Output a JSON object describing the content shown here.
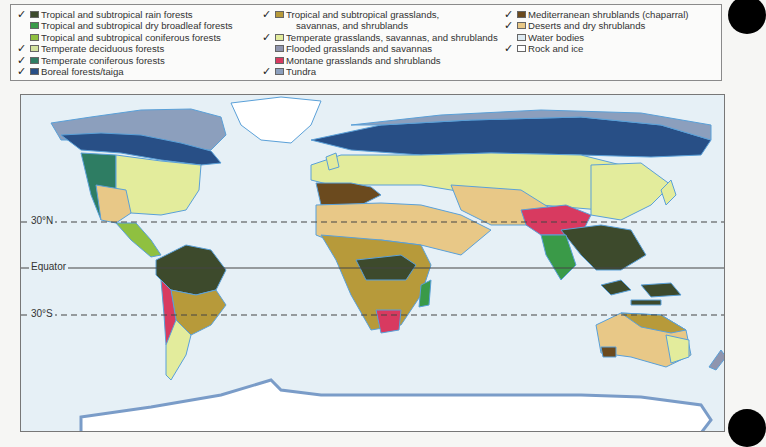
{
  "legend": {
    "columns": [
      [
        {
          "label": "Tropical and subtropical rain forests",
          "checked": true,
          "color": "#3d4a2c"
        },
        {
          "label": "Tropical and subtropical dry broadleaf forests",
          "checked": false,
          "color": "#3a9a48"
        },
        {
          "label": "Tropical and subtropical coniferous forests",
          "checked": false,
          "color": "#8fc040"
        },
        {
          "label": "Temperate deciduous forests",
          "checked": true,
          "color": "#d4e3a0"
        },
        {
          "label": "Temperate coniferous forests",
          "checked": true,
          "color": "#2e7d63"
        },
        {
          "label": "Boreal forests/taiga",
          "checked": true,
          "color": "#284f86"
        }
      ],
      [
        {
          "label": "Tropical and subtropical grasslands,",
          "label2": "savannas, and shrublands",
          "checked": true,
          "color": "#b79a3a"
        },
        {
          "label": "Temperate grasslands, savannas, and shrublands",
          "checked": true,
          "color": "#e3ec9c"
        },
        {
          "label": "Flooded grasslands and savannas",
          "checked": false,
          "color": "#8f95ae"
        },
        {
          "label": "Montane grasslands and shrublands",
          "checked": false,
          "color": "#d83a60"
        },
        {
          "label": "Tundra",
          "checked": true,
          "color": "#8c9fbd"
        }
      ],
      [
        {
          "label": "Mediterranean shrublands (chaparral)",
          "checked": true,
          "color": "#6b4a1e"
        },
        {
          "label": "Deserts and dry shrublands",
          "checked": true,
          "color": "#e8c887"
        },
        {
          "label": "Water bodies",
          "checked": false,
          "color": "#ddeaf2"
        },
        {
          "label": "Rock and ice",
          "checked": true,
          "color": "#ffffff"
        }
      ]
    ],
    "check_glyph": "✓"
  },
  "map": {
    "latitude_lines": [
      {
        "label": "30°N",
        "style": "dashed"
      },
      {
        "label": "Equator",
        "style": "solid"
      },
      {
        "label": "30°S",
        "style": "dashed"
      }
    ],
    "colors": {
      "ocean": "#e6f0f6",
      "coast": "#5aa0d8",
      "rainforest": "#3d4a2c",
      "dry_broadleaf": "#3a9a48",
      "trop_conifer": "#8fc040",
      "temp_decid": "#d4e3a0",
      "temp_conifer": "#2e7d63",
      "boreal": "#284f86",
      "trop_grass": "#b79a3a",
      "temp_grass": "#e3ec9c",
      "flooded": "#8f95ae",
      "montane": "#d83a60",
      "tundra": "#8c9fbd",
      "mediterranean": "#6b4a1e",
      "desert": "#e8c887",
      "ice": "#ffffff"
    }
  }
}
